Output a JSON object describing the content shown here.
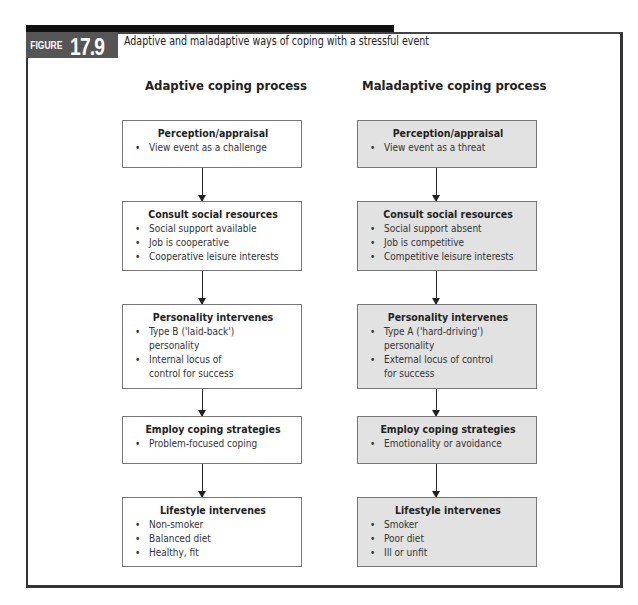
{
  "figure": {
    "label": "FIGURE",
    "number": "17.9",
    "caption": "Adaptive and maladaptive ways of coping with a stressful event"
  },
  "columns": [
    {
      "title": "Adaptive coping process",
      "style": "white",
      "boxes": [
        {
          "title": "Perception/appraisal",
          "items": [
            "View event as a challenge"
          ]
        },
        {
          "title": "Consult social resources",
          "items": [
            "Social support available",
            "Job is cooperative",
            "Cooperative leisure interests"
          ]
        },
        {
          "title": "Personality intervenes",
          "items": [
            "Type B ('laid-back') personality",
            "Internal locus of control for success"
          ]
        },
        {
          "title": "Employ coping strategies",
          "items": [
            "Problem-focused coping"
          ]
        },
        {
          "title": "Lifestyle intervenes",
          "items": [
            "Non-smoker",
            "Balanced diet",
            "Healthy, fit"
          ]
        }
      ]
    },
    {
      "title": "Maladaptive coping process",
      "style": "gray",
      "boxes": [
        {
          "title": "Perception/appraisal",
          "items": [
            "View event as a threat"
          ]
        },
        {
          "title": "Consult social resources",
          "items": [
            "Social support absent",
            "Job is competitive",
            "Competitive leisure interests"
          ]
        },
        {
          "title": "Personality intervenes",
          "items": [
            "Type A ('hard-driving') personality",
            "External locus of control for success"
          ]
        },
        {
          "title": "Employ coping strategies",
          "items": [
            "Emotionality or avoidance"
          ]
        },
        {
          "title": "Lifestyle intervenes",
          "items": [
            "Smoker",
            "Poor diet",
            "Ill or unfit"
          ]
        }
      ]
    }
  ],
  "colors": {
    "frame": "#333333",
    "label_bg": "#555555",
    "maladaptive_fill": "#e2e2e2"
  }
}
